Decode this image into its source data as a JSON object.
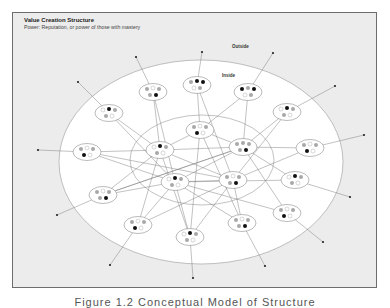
{
  "figure": {
    "title": "Value Creation Structure",
    "subtitle": "Power: Reputation, or power of those with mastery",
    "caption": "Figure 1.2 Conceptual Model of Structure"
  },
  "labels": {
    "outside": "Outside",
    "inside": "Inside"
  },
  "colors": {
    "frame_bg": "#ececec",
    "outer_fill": "#ffffff",
    "line": "#777777",
    "dot_black": "#111111",
    "dot_gray": "#a8a8a8",
    "dot_white": "#ffffff"
  },
  "regions": {
    "outer": {
      "cx": 201,
      "cy": 162,
      "rx": 142,
      "ry": 102
    },
    "inner": {
      "cx": 202,
      "cy": 160,
      "rx": 72,
      "ry": 45
    }
  },
  "nodes": [
    {
      "id": 0,
      "x": 153,
      "y": 92,
      "end": [
        136,
        57
      ]
    },
    {
      "id": 1,
      "x": 197,
      "y": 85,
      "end": [
        202,
        52
      ]
    },
    {
      "id": 2,
      "x": 248,
      "y": 92,
      "end": [
        273,
        53
      ]
    },
    {
      "id": 3,
      "x": 109,
      "y": 113,
      "end": [
        78,
        82
      ]
    },
    {
      "id": 4,
      "x": 287,
      "y": 112,
      "end": [
        335,
        86
      ]
    },
    {
      "id": 5,
      "x": 200,
      "y": 130,
      "end": null
    },
    {
      "id": 6,
      "x": 160,
      "y": 150,
      "end": null
    },
    {
      "id": 7,
      "x": 243,
      "y": 147,
      "end": null
    },
    {
      "id": 8,
      "x": 87,
      "y": 152,
      "end": [
        38,
        150
      ]
    },
    {
      "id": 9,
      "x": 310,
      "y": 148,
      "end": [
        364,
        135
      ]
    },
    {
      "id": 10,
      "x": 175,
      "y": 182,
      "end": null
    },
    {
      "id": 11,
      "x": 233,
      "y": 180,
      "end": null
    },
    {
      "id": 12,
      "x": 103,
      "y": 195,
      "end": [
        57,
        215
      ]
    },
    {
      "id": 13,
      "x": 295,
      "y": 180,
      "end": [
        350,
        197
      ]
    },
    {
      "id": 14,
      "x": 138,
      "y": 225,
      "end": [
        110,
        265
      ]
    },
    {
      "id": 15,
      "x": 287,
      "y": 213,
      "end": [
        323,
        242
      ]
    },
    {
      "id": 16,
      "x": 190,
      "y": 237,
      "end": [
        193,
        278
      ]
    },
    {
      "id": 17,
      "x": 242,
      "y": 223,
      "end": [
        265,
        266
      ]
    }
  ],
  "edges": [
    [
      0,
      6
    ],
    [
      0,
      10
    ],
    [
      1,
      5
    ],
    [
      1,
      11
    ],
    [
      2,
      7
    ],
    [
      2,
      5
    ],
    [
      3,
      10
    ],
    [
      3,
      6
    ],
    [
      4,
      7
    ],
    [
      4,
      11
    ],
    [
      5,
      6
    ],
    [
      5,
      7
    ],
    [
      5,
      16
    ],
    [
      5,
      17
    ],
    [
      6,
      7
    ],
    [
      6,
      8
    ],
    [
      6,
      12
    ],
    [
      6,
      11
    ],
    [
      6,
      16
    ],
    [
      7,
      9
    ],
    [
      7,
      10
    ],
    [
      7,
      12
    ],
    [
      7,
      15
    ],
    [
      7,
      13
    ],
    [
      8,
      10
    ],
    [
      8,
      11
    ],
    [
      9,
      11
    ],
    [
      10,
      11
    ],
    [
      10,
      12
    ],
    [
      10,
      14
    ],
    [
      10,
      16
    ],
    [
      10,
      13
    ],
    [
      11,
      17
    ],
    [
      11,
      14
    ],
    [
      11,
      16
    ],
    [
      12,
      7
    ],
    [
      14,
      6
    ],
    [
      15,
      10
    ],
    [
      17,
      10
    ]
  ],
  "dot_patterns": [
    [
      "g",
      "w",
      "g",
      "g",
      "b"
    ],
    [
      "g",
      "b",
      "b",
      "w",
      "g"
    ],
    [
      "b",
      "g",
      "b",
      "w",
      "g"
    ],
    [
      "w",
      "b",
      "g",
      "g",
      "w"
    ],
    [
      "w",
      "b",
      "g",
      "g",
      "w"
    ],
    [
      "g",
      "w",
      "g",
      "b",
      "w"
    ],
    [
      "w",
      "b",
      "g",
      "g",
      "w"
    ],
    [
      "g",
      "g",
      "g",
      "g",
      "b"
    ],
    [
      "g",
      "w",
      "g",
      "b",
      "w"
    ],
    [
      "g",
      "w",
      "g",
      "b",
      "w"
    ],
    [
      "w",
      "b",
      "g",
      "g",
      "w"
    ],
    [
      "g",
      "w",
      "g",
      "g",
      "b"
    ],
    [
      "g",
      "w",
      "g",
      "g",
      "b"
    ],
    [
      "w",
      "b",
      "g",
      "g",
      "w"
    ],
    [
      "g",
      "w",
      "g",
      "b",
      "w"
    ],
    [
      "g",
      "w",
      "g",
      "b",
      "w"
    ],
    [
      "w",
      "b",
      "g",
      "g",
      "w"
    ],
    [
      "g",
      "w",
      "g",
      "g",
      "b"
    ]
  ]
}
